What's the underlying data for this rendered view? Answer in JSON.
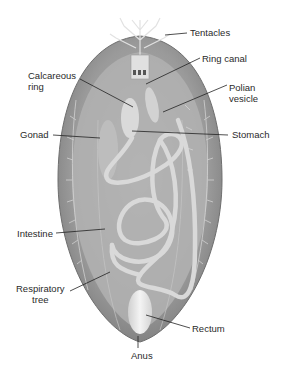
{
  "colors": {
    "body_outer": "#8a8a8a",
    "body_inner": "#b4b4b4",
    "organ": "#d6d6d6",
    "leader": "#222222",
    "text": "#2a2a2a"
  },
  "labels": {
    "tentacles": "Tentacles",
    "ring_canal": "Ring canal",
    "calcareous_ring": "Calcareous\nring",
    "polian_vesicle": "Polian\nvesicle",
    "gonad": "Gonad",
    "stomach": "Stomach",
    "intestine": "Intestine",
    "respiratory_tree": "Respiratory\ntree",
    "rectum": "Rectum",
    "anus": "Anus"
  }
}
